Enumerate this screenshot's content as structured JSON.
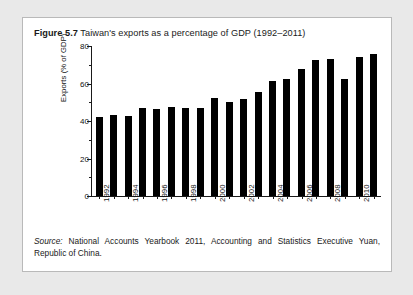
{
  "figure": {
    "label": "Figure 5.7",
    "title": "Taiwan's exports as a percentage of GDP (1992–2011)",
    "source_word": "Source:",
    "source_text": " National Accounts Yearbook 2011, Accounting and Statistics Executive Yuan, Republic of China."
  },
  "colors": {
    "page_background": "#e9e9e9",
    "figure_background": "#ffffff",
    "figure_border": "#b9b9b9",
    "bar": "#000000",
    "axis": "#1a1a1a",
    "text": "#1a1a1a"
  },
  "chart_data": {
    "type": "bar",
    "title": "Taiwan's exports as a percentage of GDP (1992–2011)",
    "xlabel": "",
    "ylabel": "Exports (% of GDP)",
    "ylim": [
      0,
      80
    ],
    "ytick_values": [
      0,
      20,
      40,
      60,
      80
    ],
    "ytick_labels": [
      "0",
      "20",
      "40",
      "60",
      "80"
    ],
    "yminor_step": 10,
    "grid": false,
    "legend": false,
    "categories": [
      "1992",
      "1993",
      "1994",
      "1995",
      "1996",
      "1997",
      "1998",
      "1999",
      "2000",
      "2001",
      "2002",
      "2003",
      "2004",
      "2005",
      "2006",
      "2007",
      "2008",
      "2009",
      "2010",
      "2011"
    ],
    "xtick_labels_shown": [
      "1992",
      "1994",
      "1996",
      "1998",
      "2000",
      "2002",
      "2004",
      "2006",
      "2008",
      "2010"
    ],
    "values": [
      42,
      43,
      42.5,
      47,
      46.5,
      47.5,
      47,
      47,
      52.5,
      50,
      52,
      55.5,
      61.5,
      62.5,
      68,
      72.5,
      73,
      62.5,
      74,
      76
    ],
    "units": "percent of GDP"
  }
}
